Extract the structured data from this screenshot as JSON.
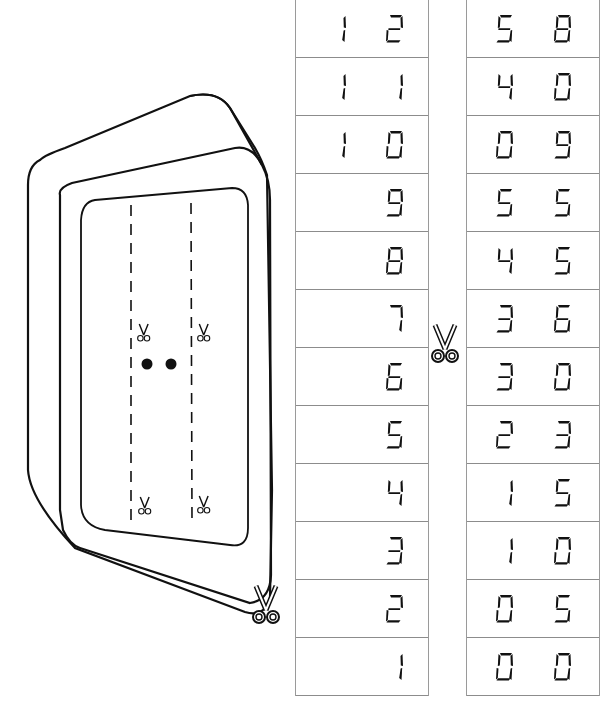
{
  "worksheet": {
    "title": "Pull-through number strip clock",
    "cut_icon": "scissors-icon",
    "hour_strip": {
      "label": "hours",
      "values": [
        "12",
        "11",
        "10",
        "9",
        "8",
        "7",
        "6",
        "5",
        "4",
        "3",
        "2",
        "1"
      ]
    },
    "minute_strip": {
      "label": "minutes",
      "values": [
        "58",
        "40",
        "09",
        "55",
        "45",
        "36",
        "30",
        "23",
        "15",
        "10",
        "05",
        "00"
      ]
    },
    "display_separator": ":"
  },
  "colors": {
    "line": "#111111",
    "cell_border": "#8c8c8c",
    "background": "#ffffff"
  }
}
